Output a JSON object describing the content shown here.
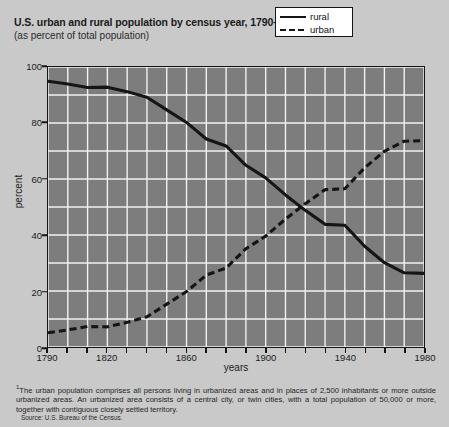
{
  "title": "U.S. urban and rural population by census year, 1790–1980",
  "title_footnote_marker": "1",
  "subtitle": "(as percent of total population)",
  "axes": {
    "ylabel": "percent",
    "xlabel": "years",
    "yticks": [
      "0",
      "20",
      "40",
      "60",
      "80",
      "100"
    ],
    "xticks": [
      "1790",
      "1820",
      "1860",
      "1900",
      "1940",
      "1980"
    ]
  },
  "legend": {
    "items": [
      {
        "label": "rural",
        "style": "solid"
      },
      {
        "label": "urban",
        "style": "dashed"
      }
    ]
  },
  "footnote": "The urban population comprises all persons living in urbanized areas and in places of 2,500 inhabitants or more outside urbanized areas. An urbanized area consists of a central city, or twin cities, with a total population of 50,000 or more, together with contiguous closely settled territory.",
  "footnote_marker": "1",
  "source": "Source: U.S. Bureau of the Census.",
  "colors": {
    "page_background": "#c9c9c9",
    "plot_background": "#7d7d7d",
    "grid": "#f2f2f2",
    "line": "#151515",
    "text": "#1a1a1a",
    "legend_background": "#ffffff"
  },
  "chart_data": {
    "type": "line",
    "title": "U.S. urban and rural population by census year, 1790–1980",
    "subtitle": "(as percent of total population)",
    "xlabel": "years",
    "ylabel": "percent",
    "xlim": [
      1790,
      1980
    ],
    "ylim": [
      0,
      100
    ],
    "grid": true,
    "grid_x_step": 10,
    "grid_y_step": 10,
    "legend_position": "top-right",
    "x": [
      1790,
      1800,
      1810,
      1820,
      1830,
      1840,
      1850,
      1860,
      1870,
      1880,
      1890,
      1900,
      1910,
      1920,
      1930,
      1940,
      1950,
      1960,
      1970,
      1980
    ],
    "series": [
      {
        "name": "rural",
        "style": "solid",
        "values": [
          94.9,
          93.9,
          92.7,
          92.8,
          91.2,
          89.2,
          84.7,
          80.2,
          74.3,
          71.8,
          64.9,
          60.4,
          54.3,
          48.8,
          43.8,
          43.5,
          36.0,
          30.1,
          26.5,
          26.3
        ]
      },
      {
        "name": "urban",
        "style": "dashed",
        "values": [
          5.1,
          6.1,
          7.3,
          7.2,
          8.8,
          10.8,
          15.3,
          19.8,
          25.7,
          28.2,
          35.1,
          39.6,
          45.7,
          51.2,
          56.2,
          56.5,
          64.0,
          69.9,
          73.5,
          73.7
        ]
      }
    ]
  }
}
